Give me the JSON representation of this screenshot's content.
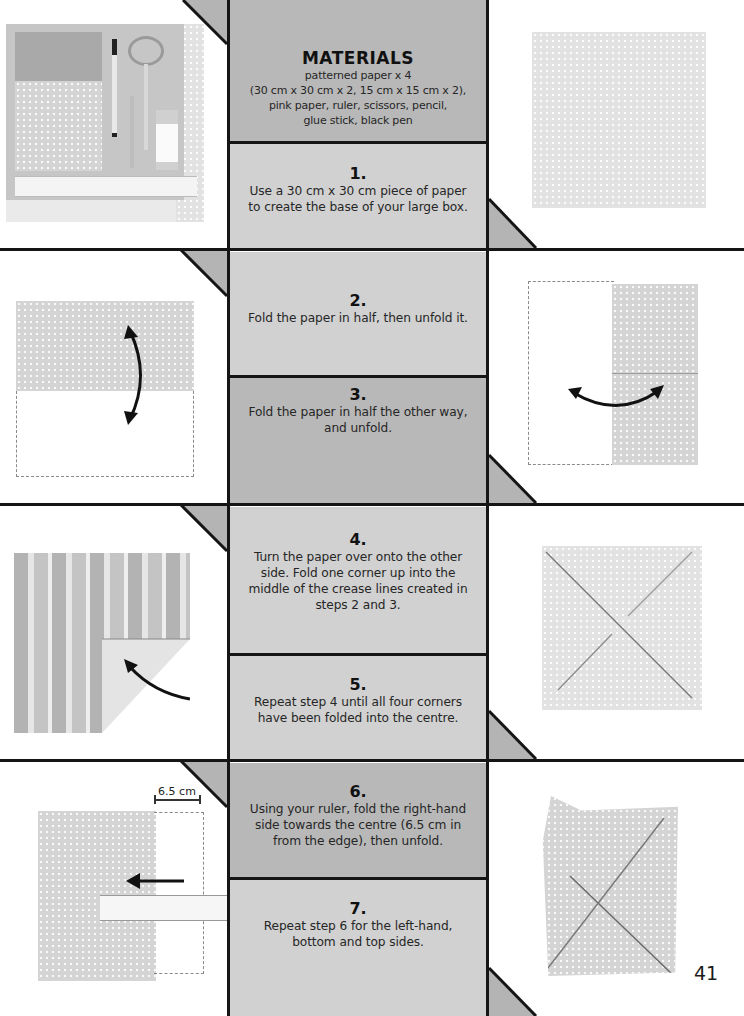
{
  "materials": {
    "title": "MATERIALS",
    "lines": [
      "patterned paper x 4",
      "(30 cm x 30 cm x 2, 15 cm x 15 cm x 2),",
      "pink paper, ruler, scissors, pencil,",
      "glue stick, black pen"
    ]
  },
  "steps": [
    {
      "number": "1.",
      "lines": [
        "Use a 30 cm x 30 cm piece of paper",
        "to create the base of your large box."
      ]
    },
    {
      "number": "2.",
      "lines": [
        "Fold the paper in half, then unfold it."
      ]
    },
    {
      "number": "3.",
      "lines": [
        "Fold the paper in half the other way,",
        "and unfold."
      ]
    },
    {
      "number": "4.",
      "lines": [
        "Turn the paper over onto the other",
        "side. Fold one corner up into the",
        "middle of the crease lines created in",
        "steps 2 and 3."
      ]
    },
    {
      "number": "5.",
      "lines": [
        "Repeat step 4 until all four corners",
        "have been folded into the centre."
      ]
    },
    {
      "number": "6.",
      "lines": [
        "Using your ruler, fold the right-hand",
        "side towards the centre (6.5 cm in",
        "from the edge), then unfold."
      ]
    },
    {
      "number": "7.",
      "lines": [
        "Repeat step 6 for the left-hand,",
        "bottom and top sides."
      ]
    }
  ],
  "photos": {
    "materials_photo": "Materials laid out: patterned papers, pink paper, pen, scissors, pencil, glue stick, ruler",
    "step1_photo": "30 cm square patterned paper",
    "step2_photo": "Paper folded in half horizontally with fold arrow",
    "step3_photo": "Paper folded in half vertically with fold arrow",
    "step4_photo": "Paper turned over with one corner folded into centre",
    "step5_photo": "All four corners folded into centre",
    "step6_photo": "Right side folded towards centre using ruler",
    "step7_photo": "All four sides creased"
  },
  "measurement_label": "6.5 cm",
  "page_number": "41",
  "colors": {
    "panel_dark": "#b8b8b8",
    "panel_light": "#d1d1d1",
    "border": "#151515",
    "triangle": "#b4b4b4"
  }
}
